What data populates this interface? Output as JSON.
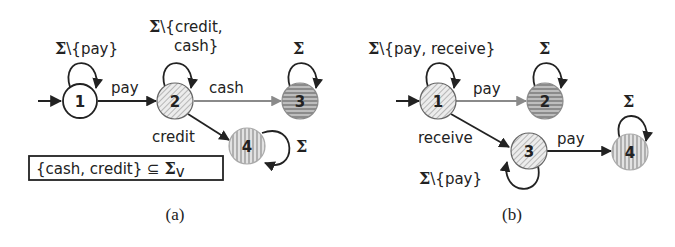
{
  "panels": {
    "a": {
      "caption": "(a)",
      "states": [
        {
          "id": "1",
          "label": "1",
          "style": "white"
        },
        {
          "id": "2",
          "label": "2",
          "style": "diagonal-hatch"
        },
        {
          "id": "3",
          "label": "3",
          "style": "horizontal-hatch-dark"
        },
        {
          "id": "4",
          "label": "4",
          "style": "vertical-hatch"
        }
      ],
      "transitions": [
        {
          "from": "start",
          "to": "1",
          "label": ""
        },
        {
          "from": "1",
          "to": "1",
          "label_sigma": "Σ",
          "label_rest": "\\{pay}"
        },
        {
          "from": "1",
          "to": "2",
          "label": "pay"
        },
        {
          "from": "2",
          "to": "2",
          "label_sigma": "Σ",
          "label_rest_line1": "\\{credit,",
          "label_rest_line2": "cash}"
        },
        {
          "from": "2",
          "to": "3",
          "label": "cash"
        },
        {
          "from": "2",
          "to": "4",
          "label": "credit"
        },
        {
          "from": "3",
          "to": "3",
          "label_sigma": "Σ"
        },
        {
          "from": "4",
          "to": "4",
          "label_sigma": "Σ"
        }
      ],
      "box": {
        "text": "{cash, credit} ⊆ ",
        "sigma": "Σ",
        "subscript": "v"
      }
    },
    "b": {
      "caption": "(b)",
      "states": [
        {
          "id": "1",
          "label": "1",
          "style": "diagonal-hatch"
        },
        {
          "id": "2",
          "label": "2",
          "style": "horizontal-hatch-dark"
        },
        {
          "id": "3",
          "label": "3",
          "style": "diagonal-hatch"
        },
        {
          "id": "4",
          "label": "4",
          "style": "vertical-hatch"
        }
      ],
      "transitions": [
        {
          "from": "start",
          "to": "1",
          "label": ""
        },
        {
          "from": "1",
          "to": "1",
          "label_sigma": "Σ",
          "label_rest": "\\{pay, receive}"
        },
        {
          "from": "1",
          "to": "2",
          "label": "pay"
        },
        {
          "from": "1",
          "to": "3",
          "label": "receive"
        },
        {
          "from": "2",
          "to": "2",
          "label_sigma": "Σ"
        },
        {
          "from": "3",
          "to": "3",
          "label_sigma": "Σ",
          "label_rest": "\\{pay}"
        },
        {
          "from": "3",
          "to": "4",
          "label": "pay"
        },
        {
          "from": "4",
          "to": "4",
          "label_sigma": "Σ"
        }
      ]
    }
  },
  "colors": {
    "edge_dark": "#222222",
    "edge_gray": "#8a8a8a",
    "fill_light": "#d9d9d9",
    "fill_dark": "#9a9a9a"
  }
}
